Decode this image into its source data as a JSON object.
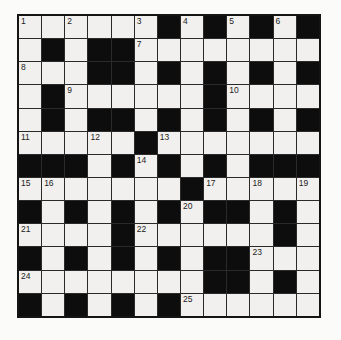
{
  "puzzle": {
    "kind": "crossword",
    "size": {
      "rows": 13,
      "cols": 13
    },
    "rows": [
      "......#.#.#.#",
      ".#.##........",
      "...##.#.#.#.#",
      ".#......#....",
      ".#.##.#.#.#.#",
      ".....#.......",
      "###.#.#.#.###",
      ".......#.....",
      "#.#.#.#.##.#.",
      "....#......#.",
      "#.#.#.#.##...",
      "........##.#.",
      "#.#.#.#......"
    ],
    "numbers": [
      {
        "num": "1",
        "row": 0,
        "col": 0
      },
      {
        "num": "2",
        "row": 0,
        "col": 2
      },
      {
        "num": "3",
        "row": 0,
        "col": 5
      },
      {
        "num": "4",
        "row": 0,
        "col": 7
      },
      {
        "num": "5",
        "row": 0,
        "col": 9
      },
      {
        "num": "6",
        "row": 0,
        "col": 11
      },
      {
        "num": "7",
        "row": 1,
        "col": 5
      },
      {
        "num": "8",
        "row": 2,
        "col": 0
      },
      {
        "num": "9",
        "row": 3,
        "col": 2
      },
      {
        "num": "10",
        "row": 3,
        "col": 9
      },
      {
        "num": "11",
        "row": 5,
        "col": 0
      },
      {
        "num": "12",
        "row": 5,
        "col": 3
      },
      {
        "num": "13",
        "row": 5,
        "col": 6
      },
      {
        "num": "14",
        "row": 6,
        "col": 5
      },
      {
        "num": "15",
        "row": 7,
        "col": 0
      },
      {
        "num": "16",
        "row": 7,
        "col": 1
      },
      {
        "num": "17",
        "row": 7,
        "col": 8
      },
      {
        "num": "18",
        "row": 7,
        "col": 10
      },
      {
        "num": "19",
        "row": 7,
        "col": 12
      },
      {
        "num": "20",
        "row": 8,
        "col": 7
      },
      {
        "num": "21",
        "row": 9,
        "col": 0
      },
      {
        "num": "22",
        "row": 9,
        "col": 5
      },
      {
        "num": "23",
        "row": 10,
        "col": 10
      },
      {
        "num": "24",
        "row": 11,
        "col": 0
      },
      {
        "num": "25",
        "row": 12,
        "col": 7
      }
    ],
    "colors": {
      "page_bg": "#fbfbfa",
      "white_cell": "#f1f0ee",
      "black_cell": "#0d0d0d",
      "grid_line": "#2a2a2a",
      "border": "#141414",
      "number": "#222222"
    }
  }
}
